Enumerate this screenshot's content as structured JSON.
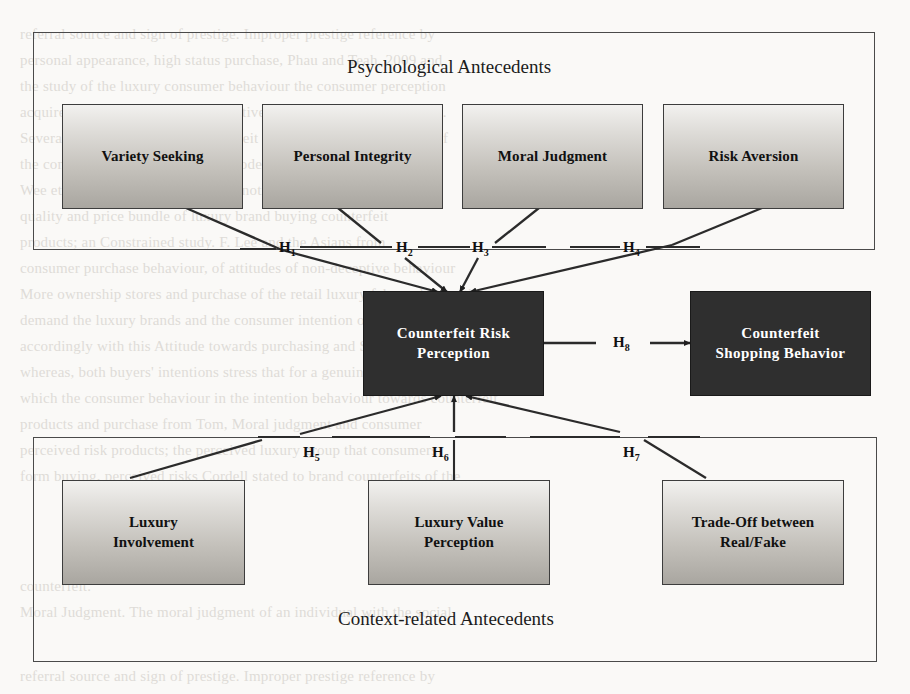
{
  "figure": {
    "groups": [
      {
        "id": "psychological",
        "title": "Psychological Antecedents"
      },
      {
        "id": "context",
        "title": "Context-related Antecedents"
      }
    ],
    "nodes": {
      "variety_seeking": "Variety Seeking",
      "personal_integrity": "Personal Integrity",
      "moral_judgment": "Moral Judgment",
      "risk_aversion": "Risk Aversion",
      "counterfeit_risk_perception_line1": "Counterfeit Risk",
      "counterfeit_risk_perception_line2": "Perception",
      "counterfeit_shopping_behavior_line1": "Counterfeit",
      "counterfeit_shopping_behavior_line2": "Shopping Behavior",
      "luxury_involvement_line1": "Luxury",
      "luxury_involvement_line2": "Involvement",
      "luxury_value_perception_line1": "Luxury Value",
      "luxury_value_perception_line2": "Perception",
      "trade_off_line1": "Trade-Off between",
      "trade_off_line2": "Real/Fake"
    },
    "hypotheses": [
      {
        "id": "H1",
        "base": "H",
        "sub": "1"
      },
      {
        "id": "H2",
        "base": "H",
        "sub": "2"
      },
      {
        "id": "H3",
        "base": "H",
        "sub": "3"
      },
      {
        "id": "H4",
        "base": "H",
        "sub": "4"
      },
      {
        "id": "H5",
        "base": "H",
        "sub": "5"
      },
      {
        "id": "H6",
        "base": "H",
        "sub": "6"
      },
      {
        "id": "H7",
        "base": "H",
        "sub": "7"
      },
      {
        "id": "H8",
        "base": "H",
        "sub": "8"
      }
    ],
    "colors": {
      "node_border": "#3d3d3d",
      "node_fill_top": "#f2f1ef",
      "node_fill_bottom": "#a9a6a0",
      "dark_node_fill": "#2f2f2f",
      "dark_node_text": "#ffffff",
      "connector": "#2b2b2b",
      "group_border": "#4a4a4a",
      "page_background": "#faf9f7"
    }
  },
  "background_bleed": {
    "lines": [
      "referral source and sign of prestige. Improper prestige reference by",
      "personal appearance, high status purchase, Phau and Teah, 2009 and",
      "the study of the luxury consumer behaviour the consumer perception",
      "acquire personal attitude and subjective norms of purchase intention.",
      "Several studies showed the counterfeit products and brand attitude of",
      "the consumer behaviour research model of the counterfeit purchase.",
      "Wee et al. (1995) where consumers noticeably have (e-lux)",
      "quality and price bundle of luxury brand buying counterfeit",
      "products; an Constrained study. F. Lee and the Asians from",
      "consumer purchase behaviour, of attitudes of non-deceptive behaviour",
      "More ownership stores and purchase of the retail luxury fake and deceptive",
      "demand the luxury brands and the consumer intention of 2007. In",
      "accordingly with this Attitude towards purchasing and Seeking, saying",
      "whereas, both buyers' intentions stress that for a genuine with buyers and",
      "which the consumer behaviour in the intention behaviour towards counterfeit",
      "products and purchase from Tom, Moral judgment and consumer",
      "perceived risk products; the perceived luxury group that consumers",
      "form buying, perceived risks Cordell stated to brand counterfeits of the",
      "counterfeit.",
      "Moral Judgment. The moral judgment of an individual with the social"
    ]
  }
}
